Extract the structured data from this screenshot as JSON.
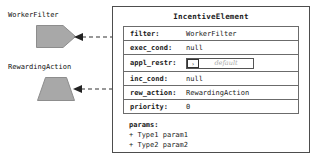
{
  "diagram": {
    "external_nodes": [
      {
        "label": "WorkerFilter",
        "shape": "pentagon"
      },
      {
        "label": "RewardingAction",
        "shape": "trapezoid"
      }
    ],
    "class_box": {
      "title": "IncentiveElement",
      "attributes": [
        {
          "key": "filter:",
          "value": "WorkerFilter"
        },
        {
          "key": "exec_cond:",
          "value": "null"
        },
        {
          "key": "appl_restr:",
          "value": "",
          "widget": "combo",
          "combo_button": "›",
          "combo_placeholder": "default"
        },
        {
          "key": "inc_cond:",
          "value": "null"
        },
        {
          "key": "rew_action:",
          "value": "RewardingAction"
        },
        {
          "key": "priority:",
          "value": "0"
        }
      ],
      "params": {
        "title": "params:",
        "items": [
          "+ Type1 param1",
          "+ Type2 param2"
        ]
      }
    },
    "connectors": [
      {
        "from": "WorkerFilter",
        "to": "filter",
        "style": "dashed",
        "arrow": "left"
      },
      {
        "from": "RewardingAction",
        "to": "rew_action",
        "style": "dashed",
        "arrow": "left"
      }
    ],
    "colors": {
      "shape_fill": "#a8a8a8",
      "shape_stroke": "#8a8a8a",
      "box_border": "#4d4d4d",
      "row_border": "#6b6b6b",
      "placeholder_text": "#a9a9a9",
      "background": "#ffffff"
    }
  }
}
